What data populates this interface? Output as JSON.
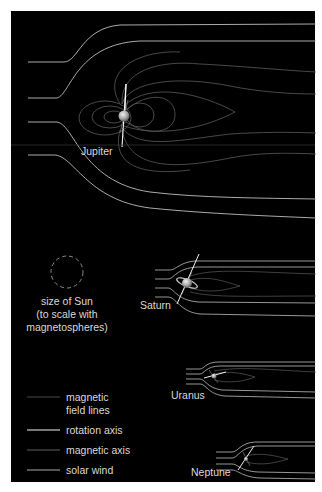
{
  "figure": {
    "background": "#000000",
    "border_color": "#ffffff",
    "colors": {
      "solar_wind": "#bdbdbd",
      "field_line": "#5a5a5a",
      "rotation_axis": "#f2f2f2",
      "magnetic_axis": "#6a6a6a",
      "label_text": "#d9d9d9",
      "planet": "#b8b8b8"
    }
  },
  "planets": [
    {
      "name": "Jupiter",
      "label": "Jupiter"
    },
    {
      "name": "Saturn",
      "label": "Saturn"
    },
    {
      "name": "Uranus",
      "label": "Uranus"
    },
    {
      "name": "Neptune",
      "label": "Neptune"
    }
  ],
  "sun_note": {
    "lines": [
      "size of Sun",
      "(to scale with",
      "magnetospheres)"
    ]
  },
  "legend": {
    "items": [
      {
        "key": "field-lines",
        "label_lines": [
          "magnetic",
          "field lines"
        ]
      },
      {
        "key": "rotation-axis",
        "label_lines": [
          "rotation axis"
        ]
      },
      {
        "key": "magnetic-axis",
        "label_lines": [
          "magnetic axis"
        ]
      },
      {
        "key": "solar-wind",
        "label_lines": [
          "solar wind"
        ]
      }
    ]
  }
}
